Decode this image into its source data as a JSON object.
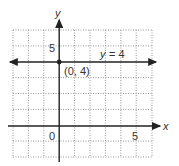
{
  "graph": {
    "x_axis_label": "x",
    "y_axis_label": "y",
    "origin_label": "0",
    "x_tick_label": "5",
    "y_tick_label": "5",
    "line_label_var": "y",
    "line_label_rest": "= 4",
    "point_label": "(0, 4)",
    "x_range": [
      -3,
      6
    ],
    "y_range": [
      -2,
      6
    ],
    "line": {
      "type": "horizontal",
      "equation": "y = 4",
      "y": 4
    },
    "point": {
      "x": 0,
      "y": 4
    },
    "colors": {
      "axis": "#222222",
      "grid": "#999999",
      "text": "#333333"
    }
  }
}
